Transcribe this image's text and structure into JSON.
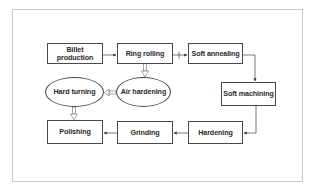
{
  "diagram": {
    "type": "process-flowchart",
    "nodes": [
      {
        "id": "billet",
        "label": "Billet\nproduction",
        "shape": "rect"
      },
      {
        "id": "ring_rolling",
        "label": "Ring rolling",
        "shape": "rect"
      },
      {
        "id": "soft_annealing",
        "label": "Soft annealing",
        "shape": "rect"
      },
      {
        "id": "soft_machining",
        "label": "Soft machining",
        "shape": "rect"
      },
      {
        "id": "hardening",
        "label": "Hardening",
        "shape": "rect"
      },
      {
        "id": "grinding",
        "label": "Grinding",
        "shape": "rect"
      },
      {
        "id": "polishing",
        "label": "Polishing",
        "shape": "rect"
      },
      {
        "id": "air_hardening",
        "label": "Air hardening",
        "shape": "ellipse"
      },
      {
        "id": "hard_turning",
        "label": "Hard turning",
        "shape": "ellipse"
      }
    ],
    "edges": [
      {
        "from": "billet",
        "to": "ring_rolling",
        "style": "solid-arrow"
      },
      {
        "from": "ring_rolling",
        "to": "soft_annealing",
        "style": "solid-arrow-with-tick"
      },
      {
        "from": "soft_annealing",
        "to": "soft_machining",
        "style": "solid-arrow"
      },
      {
        "from": "soft_machining",
        "to": "hardening",
        "style": "solid-arrow"
      },
      {
        "from": "hardening",
        "to": "grinding",
        "style": "solid-arrow"
      },
      {
        "from": "grinding",
        "to": "polishing",
        "style": "solid-arrow"
      },
      {
        "from": "ring_rolling",
        "to": "air_hardening",
        "style": "hollow-arrow"
      },
      {
        "from": "air_hardening",
        "to": "hard_turning",
        "style": "hollow-arrow"
      },
      {
        "from": "hard_turning",
        "to": "polishing",
        "style": "hollow-arrow"
      }
    ]
  },
  "colors": {
    "border": "#4a4a4a",
    "text": "#2a2a2a",
    "frame": "#c8c8c8",
    "background": "#ffffff"
  }
}
